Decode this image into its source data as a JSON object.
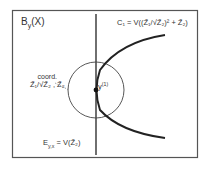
{
  "diagram": {
    "title_main": "B",
    "title_sub": "y",
    "title_rest": "(X)",
    "curve_label": "C₁ = V((Z̃₁/√Z̃₂)² + Z̃₂)",
    "coord_label_line1": "coord.",
    "coord_label_line2": "Z̃₁/√Z̃₂ , Z̃₂",
    "point_label": "y(1)",
    "point_label_main": "y",
    "point_label_sup": "(1)",
    "line_label": "E_y,x = V(Z̃₂)",
    "line_label_main": "E",
    "line_label_sub": "y,x",
    "line_label_rest": " = V(Z̃₂)",
    "colors": {
      "stroke": "#222222",
      "frame": "#555555",
      "text": "#333333",
      "background": "#ffffff"
    }
  }
}
